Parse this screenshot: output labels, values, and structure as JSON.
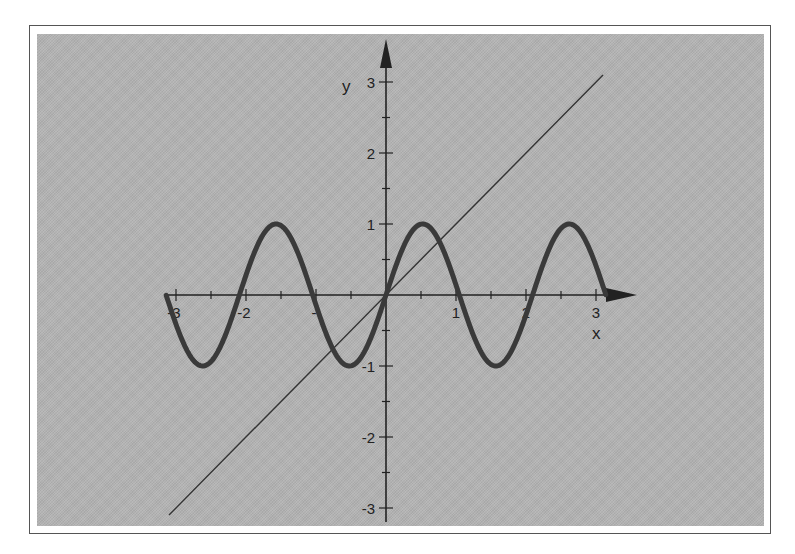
{
  "chart_data": {
    "type": "line",
    "title": "",
    "xlabel": "x",
    "ylabel": "y",
    "xlim": [
      -3.14,
      3.14
    ],
    "ylim": [
      -3,
      3
    ],
    "grid": false,
    "legend": null,
    "x_ticks": [
      -3,
      -2,
      -1,
      1,
      2,
      3
    ],
    "x_tick_labels": [
      "-3",
      "-2",
      "-",
      "1",
      "2",
      "3"
    ],
    "y_ticks": [
      -3,
      -2,
      -1,
      1,
      2,
      3
    ],
    "y_tick_labels": [
      "-3",
      "-2",
      "-1",
      "1",
      "2",
      "3"
    ],
    "series": [
      {
        "name": "y = sin(3x)",
        "function": "sin(3x)",
        "domain": [
          -3.14,
          3.14
        ],
        "style": "thick dark gray",
        "x": [
          -3.14,
          -2.62,
          -2.09,
          -1.57,
          -1.05,
          -0.52,
          0,
          0.52,
          1.05,
          1.57,
          2.09,
          2.62,
          3.14
        ],
        "y": [
          0,
          -1,
          0,
          1,
          0,
          -1,
          0,
          1,
          0,
          -1,
          0,
          1,
          0
        ]
      },
      {
        "name": "y = x",
        "function": "x",
        "domain": [
          -3.1,
          3.1
        ],
        "style": "thin dark line",
        "x": [
          -3.1,
          3.1
        ],
        "y": [
          -3.1,
          3.1
        ]
      }
    ],
    "colors": {
      "background": "#b3b3b3",
      "curve": "#3a3a3a",
      "line": "#333333",
      "axes": "#222222"
    }
  },
  "labels": {
    "x_axis": "x",
    "y_axis": "y"
  }
}
